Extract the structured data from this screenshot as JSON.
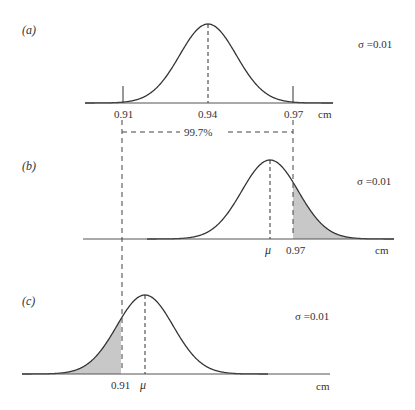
{
  "chart_data": {
    "type": "diagram",
    "title": "",
    "spec_limits": {
      "lower": 0.91,
      "upper": 0.97,
      "bracket_label": "99.7%"
    },
    "unit": "cm",
    "panels": [
      {
        "id": "a",
        "label": "(a)",
        "sigma_label": "σ =0.01",
        "mean": 0.94,
        "sigma": 0.01,
        "tick_labels": [
          "0.91",
          "0.94",
          "0.97"
        ],
        "unit_label": "cm",
        "shaded": [
          "below 0.91",
          "above 0.97"
        ]
      },
      {
        "id": "b",
        "label": "(b)",
        "sigma_label": "σ =0.01",
        "mean_label": "μ",
        "sigma": 0.01,
        "tick_labels": [
          "μ",
          "0.97"
        ],
        "unit_label": "cm",
        "shaded": [
          "above 0.97"
        ]
      },
      {
        "id": "c",
        "label": "(c)",
        "sigma_label": "σ =0.01",
        "mean_label": "μ",
        "sigma": 0.01,
        "tick_labels": [
          "0.91",
          "μ"
        ],
        "unit_label": "cm",
        "shaded": [
          "below 0.91"
        ]
      }
    ]
  },
  "geometry": {
    "curve_color": "#333333",
    "shade_color": "#c8c8c8",
    "sigma_px": 28.3,
    "panels": [
      {
        "mean_x": 208,
        "base_y": 103,
        "height": 79,
        "x0": 85,
        "x1": 333,
        "axis_x0": 85,
        "axis_x1": 333,
        "shade": [
          [
            85,
            123
          ],
          [
            293,
            333
          ]
        ]
      },
      {
        "mean_x": 270,
        "base_y": 239,
        "height": 79,
        "x0": 147,
        "x1": 394,
        "axis_x0": 83,
        "axis_x1": 394,
        "shade": [
          [
            293,
            394
          ]
        ]
      },
      {
        "mean_x": 145,
        "base_y": 374,
        "height": 79,
        "x0": 22,
        "x1": 268,
        "axis_x0": 22,
        "axis_x1": 330,
        "shade": [
          [
            22,
            121
          ]
        ]
      }
    ]
  }
}
